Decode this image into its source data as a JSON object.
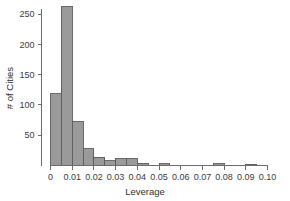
{
  "chart_data": {
    "type": "bar",
    "title": "",
    "subtitle": "",
    "xlabel": "Leverage",
    "ylabel": "# of Cities",
    "bin_width": 0.005,
    "bin_starts": [
      0.0,
      0.005,
      0.01,
      0.015,
      0.02,
      0.025,
      0.03,
      0.035,
      0.04,
      0.045,
      0.05,
      0.055,
      0.06,
      0.065,
      0.07,
      0.075,
      0.08,
      0.085,
      0.09
    ],
    "categories": [
      "0.000-0.005",
      "0.005-0.010",
      "0.010-0.015",
      "0.015-0.020",
      "0.020-0.025",
      "0.025-0.030",
      "0.030-0.035",
      "0.035-0.040",
      "0.040-0.045",
      "0.045-0.050",
      "0.050-0.055",
      "0.055-0.060",
      "0.060-0.065",
      "0.065-0.070",
      "0.070-0.075",
      "0.075-0.080",
      "0.080-0.085",
      "0.085-0.090",
      "0.090-0.095"
    ],
    "values": [
      118,
      262,
      72,
      28,
      14,
      8,
      11,
      11,
      4,
      0,
      3,
      0,
      0,
      0,
      0,
      3,
      0,
      0,
      2
    ],
    "xlim": [
      0,
      0.1
    ],
    "ylim": [
      0,
      262
    ],
    "xticks": [
      0,
      0.01,
      0.02,
      0.03,
      0.04,
      0.05,
      0.06,
      0.07,
      0.08,
      0.09,
      0.1
    ],
    "xtick_labels": [
      "0",
      "0.01",
      "0.02",
      "0.03",
      "0.04",
      "0.05",
      "0.06",
      "0.07",
      "0.08",
      "0.09",
      "0.10"
    ],
    "yticks": [
      50,
      100,
      150,
      200,
      250
    ],
    "ytick_labels": [
      "50",
      "100",
      "150",
      "200",
      "250"
    ],
    "grid": false,
    "legend": null,
    "bar_fill_color": "#9a9a9a",
    "bar_edge_color": "#5a5a5a",
    "axis_color": "#6b6b6b",
    "text_color": "#3b3b3b"
  }
}
